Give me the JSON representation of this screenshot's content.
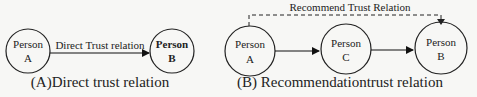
{
  "diagrams": [
    {
      "id": "A",
      "caption": "(A)Direct trust relation",
      "nodes": [
        {
          "id": "A",
          "line1": "Person",
          "line2": "A",
          "bold": false
        },
        {
          "id": "B",
          "line1": "Person",
          "line2": "B",
          "bold": true
        }
      ],
      "edges": [
        {
          "from": "A",
          "to": "B",
          "label": "Direct Trust relation",
          "style": "solid"
        }
      ]
    },
    {
      "id": "B",
      "caption": "(B) Recommendationtrust relation",
      "nodes": [
        {
          "id": "A",
          "line1": "Person",
          "line2": "A",
          "bold": false
        },
        {
          "id": "C",
          "line1": "Person",
          "line2": "C",
          "bold": false
        },
        {
          "id": "B",
          "line1": "Person",
          "line2": "B",
          "bold": false
        }
      ],
      "edges": [
        {
          "from": "A",
          "to": "C",
          "label": "",
          "style": "solid"
        },
        {
          "from": "C",
          "to": "B",
          "label": "",
          "style": "solid"
        },
        {
          "from": "A",
          "to": "B",
          "label": "Recommend Trust Relation",
          "style": "dashed"
        }
      ]
    }
  ]
}
